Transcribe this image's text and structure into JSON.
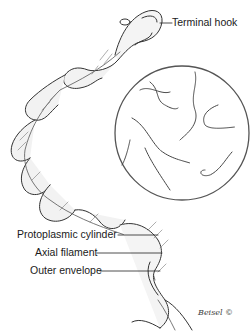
{
  "figure": {
    "labels": {
      "terminal_hook": "Terminal hook",
      "protoplasmic_cylinder": "Protoplasmic cylinder",
      "axial_filament": "Axial filament",
      "outer_envelope": "Outer envelope"
    },
    "inset": "Magnified view circle showing multiple spirochetes",
    "signature": "Beisel ©"
  }
}
